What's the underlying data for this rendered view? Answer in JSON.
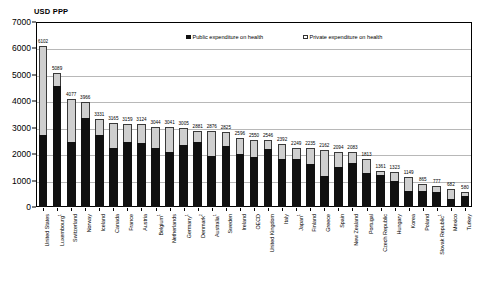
{
  "chart_data": {
    "type": "bar",
    "subtype": "stacked-bar",
    "title": "USD PPP",
    "xlabel": "",
    "ylabel": "USD PPP",
    "ylim": [
      0,
      7000
    ],
    "ytick_step": 1000,
    "yticks": [
      "0",
      "1000",
      "2000",
      "3000",
      "4000",
      "5000",
      "6000",
      "7000"
    ],
    "grid": true,
    "legend_position": "top-center",
    "categories": [
      "United States",
      "Luxembourg",
      "Switzerland",
      "Norway",
      "Iceland",
      "Canada",
      "France",
      "Austria",
      "Belgium",
      "Netherlands",
      "Germany",
      "Denmark",
      "Australia",
      "Sweden",
      "Ireland",
      "OECD",
      "United Kingdom",
      "Italy",
      "Japan",
      "Finland",
      "Greece",
      "Spain",
      "New Zealand",
      "Portugal",
      "Czech Republic",
      "Hungary",
      "Korea",
      "Poland",
      "Slovak Republic",
      "Mexico",
      "Turkey"
    ],
    "category_footnotes": [
      "",
      "1",
      "",
      "",
      "",
      "",
      "",
      "",
      "1",
      "",
      "1",
      "2",
      "1",
      "",
      "",
      "",
      "",
      "",
      "1",
      "",
      "",
      "",
      "",
      "",
      "",
      "",
      "",
      "",
      "1",
      "",
      ""
    ],
    "totals": [
      6102,
      5089,
      4077,
      3966,
      3331,
      3165,
      3159,
      3124,
      3044,
      3041,
      3005,
      2881,
      2876,
      2825,
      2596,
      2550,
      2546,
      2392,
      2249,
      2235,
      2162,
      2094,
      2083,
      1813,
      1361,
      1323,
      1149,
      865,
      777,
      682,
      580
    ],
    "series": [
      {
        "name": "Public expenditure on health",
        "color": "#111111",
        "values": [
          2724,
          4580,
          2468,
          3354,
          2741,
          2248,
          2462,
          2428,
          2235,
          2070,
          2334,
          2452,
          1925,
          2313,
          2011,
          1875,
          2204,
          1822,
          1834,
          1643,
          1166,
          1524,
          1669,
          1286,
          1229,
          968,
          620,
          601,
          575,
          304,
          417
        ]
      },
      {
        "name": "Private expenditure on health",
        "color": "#cfcfcf",
        "values": [
          3378,
          509,
          1609,
          612,
          590,
          917,
          697,
          696,
          809,
          971,
          671,
          429,
          951,
          512,
          585,
          675,
          342,
          570,
          415,
          592,
          996,
          570,
          414,
          527,
          132,
          355,
          529,
          264,
          202,
          378,
          163
        ]
      }
    ]
  },
  "legend": {
    "public_label": "Public expenditure on health",
    "private_label": "Private expenditure on health"
  }
}
